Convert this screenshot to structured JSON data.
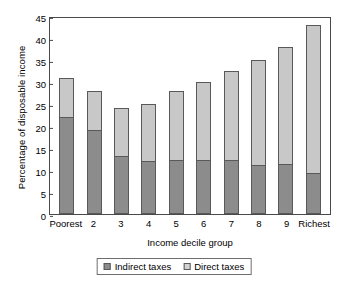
{
  "chart_data": {
    "type": "bar",
    "stacked": true,
    "title": "",
    "xlabel": "Income decile group",
    "ylabel": "Percentage of disposable income",
    "categories": [
      "Poorest",
      "2",
      "3",
      "4",
      "5",
      "6",
      "7",
      "8",
      "9",
      "Richest"
    ],
    "ylim": [
      0,
      45
    ],
    "ytick_step": 5,
    "yticks": [
      "45",
      "40",
      "35",
      "30",
      "25",
      "20",
      "15",
      "10",
      "5",
      "0"
    ],
    "grid": false,
    "legend_position": "bottom",
    "series": [
      {
        "name": "Indirect taxes",
        "color": "#8c8c8c",
        "values": [
          22,
          19,
          13,
          12,
          12,
          12,
          12,
          11,
          11,
          9
        ]
      },
      {
        "name": "Direct taxes",
        "color": "#c8c8c8",
        "values": [
          9,
          9,
          11,
          13,
          16,
          18,
          20.5,
          24,
          27,
          34
        ]
      }
    ],
    "totals": [
      31,
      28,
      24,
      25,
      28,
      30,
      32.5,
      35,
      38,
      43
    ]
  },
  "legend": {
    "items": [
      {
        "label": "Indirect taxes",
        "swatch": "indirect-swatch"
      },
      {
        "label": "Direct taxes",
        "swatch": "direct-swatch"
      }
    ]
  }
}
